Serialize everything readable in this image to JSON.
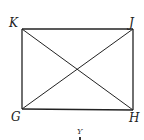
{
  "diagram": {
    "type": "rectangle-with-diagonals",
    "stroke_color": "#222222",
    "vertices": [
      {
        "id": "K",
        "label": "K",
        "x": 22,
        "y": 29
      },
      {
        "id": "J",
        "label": "J",
        "x": 133,
        "y": 29
      },
      {
        "id": "H",
        "label": "H",
        "x": 133,
        "y": 110
      },
      {
        "id": "G",
        "label": "G",
        "x": 22,
        "y": 109
      }
    ],
    "edges": [
      [
        "K",
        "J"
      ],
      [
        "J",
        "H"
      ],
      [
        "H",
        "G"
      ],
      [
        "G",
        "K"
      ]
    ],
    "diagonals": [
      [
        "K",
        "H"
      ],
      [
        "G",
        "J"
      ]
    ],
    "bottom_label": "Y"
  }
}
